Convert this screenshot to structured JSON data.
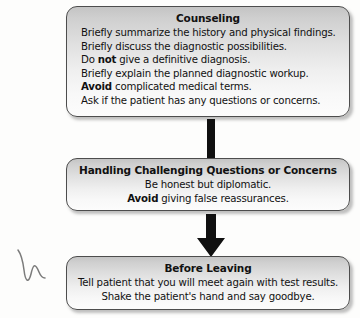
{
  "diagram": {
    "type": "flowchart",
    "orientation": "vertical",
    "nodes": [
      {
        "id": "counseling",
        "title": "Counseling",
        "align": "left",
        "lines": [
          {
            "segments": [
              {
                "text": "Briefly summarize the history and physical findings.",
                "bold": false
              }
            ]
          },
          {
            "segments": [
              {
                "text": "Briefly discuss the diagnostic possibilities.",
                "bold": false
              }
            ]
          },
          {
            "segments": [
              {
                "text": "Do ",
                "bold": false
              },
              {
                "text": "not",
                "bold": true
              },
              {
                "text": " give a definitive diagnosis.",
                "bold": false
              }
            ]
          },
          {
            "segments": [
              {
                "text": "Briefly explain the planned diagnostic workup.",
                "bold": false
              }
            ]
          },
          {
            "segments": [
              {
                "text": "Avoid",
                "bold": true
              },
              {
                "text": " complicated medical terms.",
                "bold": false
              }
            ]
          },
          {
            "segments": [
              {
                "text": "Ask if the patient has any questions or concerns.",
                "bold": false
              }
            ]
          }
        ]
      },
      {
        "id": "handling",
        "title": "Handling Challenging Questions or Concerns",
        "align": "center",
        "lines": [
          {
            "segments": [
              {
                "text": "Be honest but diplomatic.",
                "bold": false
              }
            ]
          },
          {
            "segments": [
              {
                "text": "Avoid",
                "bold": true
              },
              {
                "text": " giving false reassurances.",
                "bold": false
              }
            ]
          }
        ]
      },
      {
        "id": "before-leaving",
        "title": "Before Leaving",
        "align": "center",
        "lines": [
          {
            "segments": [
              {
                "text": "Tell patient that you will meet again with test results.",
                "bold": false
              }
            ]
          },
          {
            "segments": [
              {
                "text": "Shake the patient's hand and say goodbye.",
                "bold": false
              }
            ]
          }
        ]
      }
    ],
    "connectors": [
      {
        "id": "bar",
        "from": "counseling",
        "to": "handling",
        "shape": "thick-bar"
      },
      {
        "id": "arrow",
        "from": "handling",
        "to": "before-leaving",
        "shape": "down-arrow"
      }
    ],
    "annotations": [
      {
        "id": "margin-ink",
        "kind": "handwritten-mark",
        "location": "left-margin"
      }
    ],
    "colors": {
      "box_border": "#4d4d4d",
      "box_fill_top": "#c4c4c4",
      "box_fill_bottom": "#fcfcfc",
      "connector": "#101010",
      "text": "#111111",
      "page": "#fdfdfc"
    }
  }
}
